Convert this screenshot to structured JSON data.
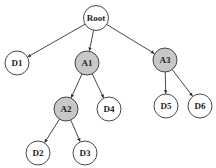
{
  "diagram": {
    "type": "tree",
    "colors": {
      "plain_fill": "#ffffff",
      "highlight_fill": "#c8c8c8",
      "stroke": "#333333"
    },
    "nodes": [
      {
        "id": "Root",
        "label": "Root",
        "x": 96,
        "y": 18,
        "r": 12.5,
        "highlight": false
      },
      {
        "id": "D1",
        "label": "D1",
        "x": 17,
        "y": 63,
        "r": 12,
        "highlight": false
      },
      {
        "id": "A1",
        "label": "A1",
        "x": 87,
        "y": 63,
        "r": 12,
        "highlight": true
      },
      {
        "id": "A3",
        "label": "A3",
        "x": 165,
        "y": 60,
        "r": 12,
        "highlight": true
      },
      {
        "id": "A2",
        "label": "A2",
        "x": 66,
        "y": 109,
        "r": 12,
        "highlight": true
      },
      {
        "id": "D4",
        "label": "D4",
        "x": 109,
        "y": 109,
        "r": 12,
        "highlight": false
      },
      {
        "id": "D5",
        "label": "D5",
        "x": 166,
        "y": 106,
        "r": 12,
        "highlight": false
      },
      {
        "id": "D6",
        "label": "D6",
        "x": 200,
        "y": 106,
        "r": 12,
        "highlight": false
      },
      {
        "id": "D2",
        "label": "D2",
        "x": 38,
        "y": 153,
        "r": 12,
        "highlight": false
      },
      {
        "id": "D3",
        "label": "D3",
        "x": 85,
        "y": 153,
        "r": 12,
        "highlight": false
      }
    ],
    "edges": [
      {
        "from": "Root",
        "to": "D1"
      },
      {
        "from": "Root",
        "to": "A1"
      },
      {
        "from": "Root",
        "to": "A3"
      },
      {
        "from": "A1",
        "to": "A2"
      },
      {
        "from": "A1",
        "to": "D4"
      },
      {
        "from": "A3",
        "to": "D5"
      },
      {
        "from": "A3",
        "to": "D6"
      },
      {
        "from": "A2",
        "to": "D2"
      },
      {
        "from": "A2",
        "to": "D3"
      }
    ]
  }
}
